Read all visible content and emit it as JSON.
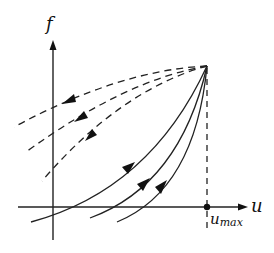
{
  "diagram": {
    "type": "phase-portrait",
    "axes": {
      "x_label": "u",
      "y_label": "f",
      "marker_label_main": "u",
      "marker_label_sub": "max"
    },
    "apex_point": "(u_max, f_max)",
    "trajectories": {
      "solid_count": 3,
      "solid_direction": "toward apex",
      "dashed_count": 3,
      "dashed_direction": "away from apex"
    },
    "colors": {
      "ink": "#222222",
      "background": "#ffffff"
    }
  }
}
